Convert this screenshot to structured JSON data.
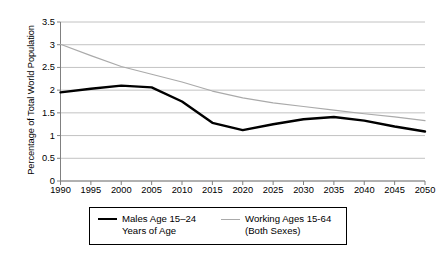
{
  "chart_data": {
    "type": "line",
    "title": "",
    "xlabel": "",
    "ylabel": "Percentage of Total World Population",
    "x": [
      1990,
      1995,
      2000,
      2005,
      2010,
      2015,
      2020,
      2025,
      2030,
      2035,
      2040,
      2045,
      2050
    ],
    "xtick_labels": [
      "1990",
      "1995",
      "2000",
      "2005",
      "2010",
      "2015",
      "2020",
      "2025",
      "2030",
      "2035",
      "2040",
      "2045",
      "2050"
    ],
    "ytick_labels": [
      "0",
      "0.5",
      "1",
      "1.5",
      "2",
      "2.5",
      "3",
      "3.5"
    ],
    "ytick_values": [
      0,
      0.5,
      1,
      1.5,
      2,
      2.5,
      3,
      3.5
    ],
    "ylim": [
      0,
      3.5
    ],
    "xlim": [
      1990,
      2050
    ],
    "grid": "horizontal",
    "legend_position": "bottom",
    "series": [
      {
        "name": "Males Age 15–24 Years of Age",
        "legend_line1": "Males Age 15–24",
        "legend_line2": "Years of Age",
        "color": "#000000",
        "width": 2.4,
        "values": [
          1.95,
          2.03,
          2.1,
          2.06,
          1.75,
          1.28,
          1.12,
          1.25,
          1.36,
          1.41,
          1.33,
          1.2,
          1.09
        ]
      },
      {
        "name": "Working Ages 15-64 (Both Sexes)",
        "legend_line1": "Working Ages 15-64",
        "legend_line2": "(Both Sexes)",
        "color": "#aaaaaa",
        "width": 1.2,
        "values": [
          3.01,
          2.76,
          2.52,
          2.35,
          2.18,
          1.98,
          1.83,
          1.72,
          1.64,
          1.56,
          1.48,
          1.41,
          1.33
        ]
      }
    ]
  },
  "axis": {
    "color": "#808080",
    "grid_color": "#b3b3b3"
  }
}
